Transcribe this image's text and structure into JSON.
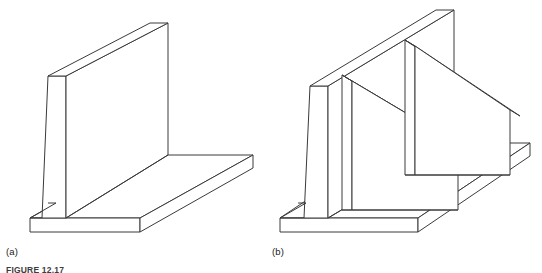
{
  "figure": {
    "caption": "FIGURE 12.17",
    "panels": [
      {
        "label": "(a)",
        "name": "cantilever-retaining-wall",
        "description": "Cantilever retaining wall shown in isometric view: a tapered vertical stem rising from a horizontal base slab forming a T shape."
      },
      {
        "label": "(b)",
        "name": "counterfort-retaining-wall",
        "description": "Counterfort retaining wall shown in isometric view: a vertical stem on a horizontal base slab braced by two triangular counterfort ribs on the backfill side."
      }
    ]
  },
  "style": {
    "stroke_color": "#3a3a3a",
    "fill_color": "#ffffff",
    "background": "#ffffff",
    "label_color": "#1a1a1a",
    "caption_color": "#3c3c3c"
  }
}
